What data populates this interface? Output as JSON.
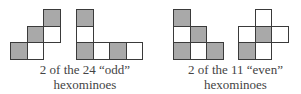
{
  "colors": {
    "filled": "#a9a9a9",
    "empty": "#ffffff",
    "border": "#3a3a3a",
    "text": "#444444"
  },
  "groups": [
    {
      "caption_line1": "2 of the 24 “odd”",
      "caption_line2": "hexominoes",
      "shapes": [
        {
          "name": "odd-hexomino-staircase",
          "cells": [
            {
              "row": 0,
              "col": 2,
              "fill": "grey"
            },
            {
              "row": 1,
              "col": 1,
              "fill": "grey"
            },
            {
              "row": 1,
              "col": 2,
              "fill": "white"
            },
            {
              "row": 2,
              "col": 0,
              "fill": "grey"
            },
            {
              "row": 2,
              "col": 1,
              "fill": "white"
            }
          ]
        },
        {
          "name": "odd-hexomino-l",
          "cells": [
            {
              "row": 0,
              "col": 0,
              "fill": "grey"
            },
            {
              "row": 1,
              "col": 0,
              "fill": "white"
            },
            {
              "row": 2,
              "col": 0,
              "fill": "grey"
            },
            {
              "row": 2,
              "col": 1,
              "fill": "white"
            },
            {
              "row": 2,
              "col": 2,
              "fill": "grey"
            },
            {
              "row": 2,
              "col": 3,
              "fill": "white"
            }
          ]
        }
      ]
    },
    {
      "caption_line1": "2 of the 11 “even”",
      "caption_line2": "hexominoes",
      "shapes": [
        {
          "name": "even-hexomino-steps",
          "cells": [
            {
              "row": 0,
              "col": 0,
              "fill": "grey"
            },
            {
              "row": 1,
              "col": 0,
              "fill": "white"
            },
            {
              "row": 1,
              "col": 1,
              "fill": "grey"
            },
            {
              "row": 2,
              "col": 0,
              "fill": "grey"
            },
            {
              "row": 2,
              "col": 1,
              "fill": "white"
            },
            {
              "row": 2,
              "col": 2,
              "fill": "grey"
            }
          ]
        },
        {
          "name": "even-hexomino-cross",
          "cells": [
            {
              "row": 0,
              "col": 1,
              "fill": "white"
            },
            {
              "row": 1,
              "col": 0,
              "fill": "white"
            },
            {
              "row": 1,
              "col": 1,
              "fill": "grey"
            },
            {
              "row": 1,
              "col": 2,
              "fill": "white"
            },
            {
              "row": 2,
              "col": 0,
              "fill": "grey"
            },
            {
              "row": 2,
              "col": 1,
              "fill": "white"
            }
          ]
        }
      ]
    }
  ]
}
